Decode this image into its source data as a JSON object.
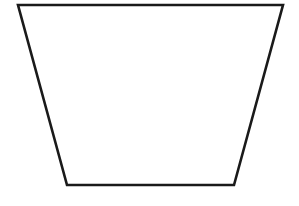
{
  "canvas": {
    "width": 299,
    "height": 206,
    "background_color": "#ffffff"
  },
  "figure": {
    "name": "trapezoid",
    "fill": "none",
    "stroke_color": "#1a1a1a",
    "stroke_width": 2.6,
    "vertices": [
      {
        "label": "top-left",
        "x": 18,
        "y": 5
      },
      {
        "label": "top-right",
        "x": 283,
        "y": 5
      },
      {
        "label": "bottom-right",
        "x": 234,
        "y": 185
      },
      {
        "label": "bottom-left",
        "x": 67,
        "y": 185
      }
    ],
    "points_attr": "18,5 283,5 234,185 67,185",
    "edges": [
      {
        "name": "top-edge",
        "from": "top-left",
        "to": "top-right",
        "length_px": 265
      },
      {
        "name": "right-edge",
        "from": "top-right",
        "to": "bottom-right",
        "length_px": 187
      },
      {
        "name": "bottom-edge",
        "from": "bottom-right",
        "to": "bottom-left",
        "length_px": 167
      },
      {
        "name": "left-edge",
        "from": "bottom-left",
        "to": "top-left",
        "length_px": 187
      }
    ]
  },
  "chart_data": {
    "type": "line",
    "title": "",
    "xlabel": "",
    "ylabel": "",
    "xlim": [
      0,
      299
    ],
    "ylim": [
      0,
      206
    ],
    "grid": false,
    "legend": null,
    "series": [
      {
        "name": "trapezoid-outline",
        "closed": true,
        "x": [
          18,
          283,
          234,
          67
        ],
        "y": [
          5,
          5,
          185,
          185
        ]
      }
    ]
  }
}
